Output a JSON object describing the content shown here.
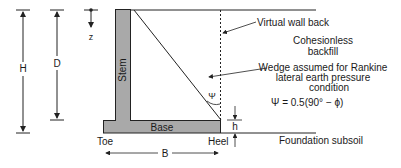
{
  "diagram": {
    "labels": {
      "H": "H",
      "D": "D",
      "z": "z",
      "stem": "Stem",
      "base": "Base",
      "toe": "Toe",
      "heel": "Heel",
      "B": "B",
      "h": "h",
      "psi": "Ψ",
      "virtual_wall_back": "Virtual wall back",
      "backfill_line1": "Cohesionless",
      "backfill_line2": "backfill",
      "wedge_line1": "Wedge assumed for Rankine",
      "wedge_line2": "lateral earth pressure",
      "wedge_line3": "condition",
      "formula": "Ψ = 0.5(90° − ϕ)",
      "foundation": "Foundation subsoil"
    },
    "colors": {
      "wall_fill": "#a9a9a9",
      "line": "#222222",
      "background": "#ffffff"
    }
  }
}
